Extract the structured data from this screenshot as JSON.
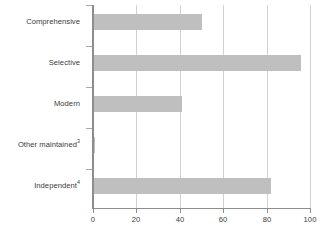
{
  "chart_data": {
    "type": "bar",
    "orientation": "horizontal",
    "title": "",
    "subtitle": "",
    "xlabel": "",
    "ylabel": "",
    "categories": [
      "Comprehensive",
      "Selective",
      "Modern",
      "Other maintained",
      "Independent"
    ],
    "category_footnotes": [
      "",
      "",
      "",
      "3",
      "4"
    ],
    "values": [
      50,
      96,
      41,
      1,
      82
    ],
    "xlim": [
      0,
      100
    ],
    "xticks": [
      0,
      20,
      40,
      60,
      80,
      100
    ],
    "xtick_labels": [
      "0",
      "20",
      "40",
      "60",
      "80",
      "100"
    ],
    "grid": "vertical",
    "legend": "none",
    "series": [
      {
        "name": "",
        "values": [
          50,
          96,
          41,
          1,
          82
        ]
      }
    ],
    "colors": {
      "bar_fill": "#bfbfbf",
      "gridline": "#d2d2d2",
      "axis_line": "#8d8d8d",
      "text": "#3b3b3b",
      "background": "#ffffff"
    }
  }
}
